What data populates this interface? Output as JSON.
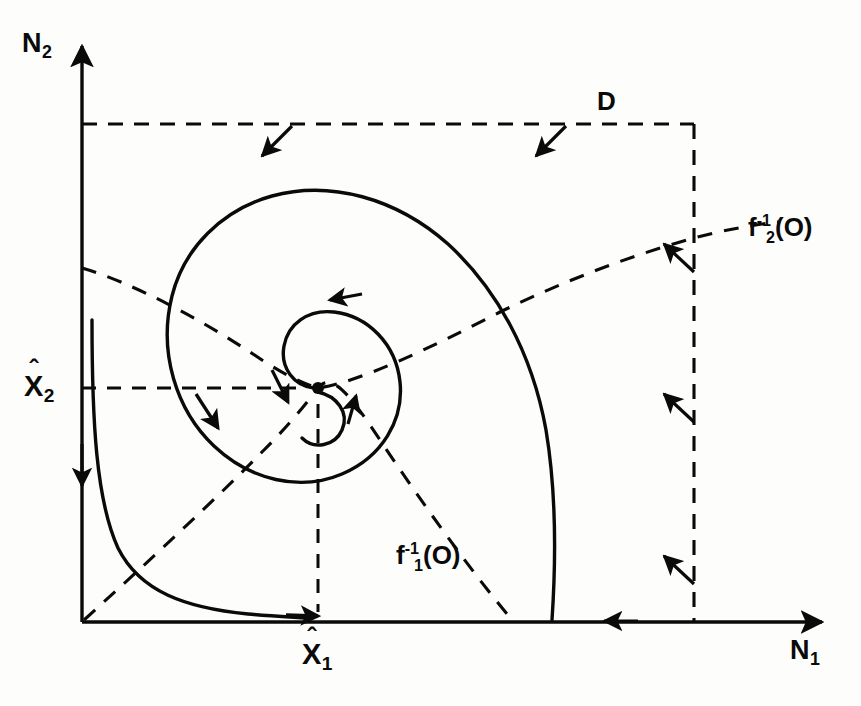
{
  "figure": {
    "type": "phase-plane-diagram",
    "background_color": "#fdfdfb",
    "ink_color": "#0a0a0a"
  },
  "axes": {
    "x_axis": {
      "name": "horizontal-axis",
      "label": "N",
      "label_subscript": "1",
      "origin_px": [
        82,
        622
      ],
      "end_px": [
        828,
        622
      ],
      "arrow": "right"
    },
    "y_axis": {
      "name": "vertical-axis",
      "label": "N",
      "label_subscript": "2",
      "origin_px": [
        82,
        622
      ],
      "end_px": [
        82,
        40
      ],
      "arrow": "up"
    }
  },
  "equilibrium": {
    "name": "interior-equilibrium",
    "x_tick_label": "X",
    "x_tick_subscript": "1",
    "x_tick_hat": "ˆ",
    "y_tick_label": "X",
    "y_tick_subscript": "2",
    "y_tick_hat": "ˆ",
    "point_px": [
      318,
      388
    ],
    "x_foot_px": [
      318,
      622
    ],
    "y_foot_px": [
      82,
      388
    ]
  },
  "region": {
    "name": "invariant-region",
    "label": "D",
    "style": "dashed",
    "top_y_px": 124,
    "right_x_px": 694,
    "left_x_px": 82,
    "bottom_y_px": 622
  },
  "nullclines": [
    {
      "name": "nullcline-f1",
      "label_base": "f",
      "label_subscript": "1",
      "label_superscript": "-1",
      "label_argument": "(O)",
      "style": "dashed",
      "runs": "from origin up and to the right through the equilibrium"
    },
    {
      "name": "nullcline-f2",
      "label_base": "f",
      "label_subscript": "2",
      "label_superscript": "-1",
      "label_argument": "(O)",
      "style": "dashed",
      "runs": "from the N2 axis rising gently to the right through the equilibrium"
    }
  ],
  "trajectories": [
    {
      "name": "spiral-trajectory",
      "style": "solid",
      "direction": "clockwise inward to equilibrium"
    },
    {
      "name": "corner-trajectory",
      "style": "solid",
      "direction": "down the left then right along the bottom toward X1-hat"
    }
  ],
  "flow_arrows": {
    "top_boundary": 2,
    "right_boundary": 3,
    "bottom_axis": 1,
    "left_axis": 1
  }
}
